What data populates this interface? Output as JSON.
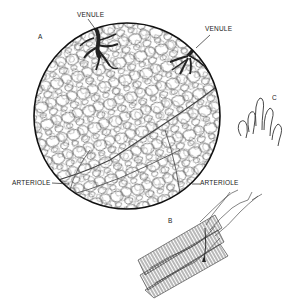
{
  "figure": {
    "panels": [
      {
        "id": "A",
        "label": "A",
        "description": "circular magnified view of capillary network with venules and arterioles"
      },
      {
        "id": "B",
        "label": "B",
        "description": "capillaries around muscle fibers"
      },
      {
        "id": "C",
        "label": "C",
        "description": "capillary loops"
      }
    ],
    "labels": {
      "venule_left": "VENULE",
      "venule_right": "VENULE",
      "arteriole_left": "ARTERIOLE",
      "arteriole_right": "ARTERIOLE",
      "panel_a": "A",
      "panel_b": "B",
      "panel_c": "C"
    },
    "colors": {
      "ink": "#1a1a1a",
      "line": "#444444",
      "venule_fill": "#2a2a2a",
      "background": "#ffffff"
    }
  }
}
